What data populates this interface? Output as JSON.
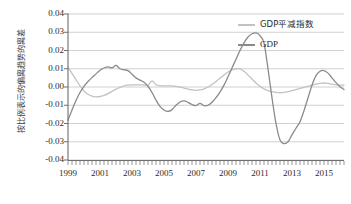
{
  "chart": {
    "type": "line",
    "title": "",
    "y_axis_title": "按比例表示的偏离趋势的离差",
    "x_axis_title": "",
    "ylim": [
      -0.04,
      0.04
    ],
    "xlim": [
      1999.0,
      2016.25
    ],
    "grid": true,
    "legend_position": "top-right",
    "y_ticks": [
      "0.04",
      "0.03",
      "0.02",
      "0.01",
      "0.00",
      "-0.01",
      "-0.02",
      "-0.03",
      "-0.04"
    ],
    "y_tick_values": [
      0.04,
      0.03,
      0.02,
      0.01,
      0.0,
      -0.01,
      -0.02,
      -0.03,
      -0.04
    ],
    "x_ticks": [
      "1999",
      "2001",
      "2003",
      "2005",
      "2007",
      "2009",
      "2011",
      "2013",
      "2015"
    ],
    "x_tick_values": [
      1999,
      2001,
      2003,
      2005,
      2007,
      2009,
      2011,
      2013,
      2015
    ],
    "colors": {
      "deflator": "#c2c2c2",
      "gdp": "#8a8a8a",
      "gridline": "#d0d0d0",
      "axis": "#6e6e6e",
      "text": "#2b2b2b"
    }
  },
  "chart_data": {
    "type": "line",
    "title": "",
    "xlabel": "",
    "ylabel": "按比例表示的偏离趋势的离差",
    "ylim": [
      -0.04,
      0.04
    ],
    "xlim": [
      1999.0,
      2016.25
    ],
    "grid": true,
    "legend_position": "top-right",
    "x_tick_labels": [
      "1999",
      "2001",
      "2003",
      "2005",
      "2007",
      "2009",
      "2011",
      "2013",
      "2015"
    ],
    "y_tick_labels": [
      "0.04",
      "0.03",
      "0.02",
      "0.01",
      "0.00",
      "-0.01",
      "-0.02",
      "-0.03",
      "-0.04"
    ],
    "x": [
      1999.0,
      1999.25,
      1999.5,
      1999.75,
      2000.0,
      2000.25,
      2000.5,
      2000.75,
      2001.0,
      2001.25,
      2001.5,
      2001.75,
      2002.0,
      2002.25,
      2002.5,
      2002.75,
      2003.0,
      2003.25,
      2003.5,
      2003.75,
      2004.0,
      2004.25,
      2004.5,
      2004.75,
      2005.0,
      2005.25,
      2005.5,
      2005.75,
      2006.0,
      2006.25,
      2006.5,
      2006.75,
      2007.0,
      2007.25,
      2007.5,
      2007.75,
      2008.0,
      2008.25,
      2008.5,
      2008.75,
      2009.0,
      2009.25,
      2009.5,
      2009.75,
      2010.0,
      2010.25,
      2010.5,
      2010.75,
      2011.0,
      2011.25,
      2011.5,
      2011.75,
      2012.0,
      2012.25,
      2012.5,
      2012.75,
      2013.0,
      2013.25,
      2013.5,
      2013.75,
      2014.0,
      2014.25,
      2014.5,
      2014.75,
      2015.0,
      2015.25,
      2015.5,
      2015.75,
      2016.0,
      2016.25
    ],
    "series": [
      {
        "name": "GDP平减指数",
        "color": "#c2c2c2",
        "values": [
          0.0108,
          0.0075,
          0.004,
          0.0006,
          -0.0022,
          -0.004,
          -0.005,
          -0.0054,
          -0.0052,
          -0.0046,
          -0.0036,
          -0.0024,
          -0.0012,
          -0.0002,
          0.0006,
          0.001,
          0.0012,
          0.0012,
          0.0012,
          0.0011,
          0.001,
          0.0034,
          0.0012,
          0.0007,
          0.0006,
          0.0006,
          0.0006,
          0.0004,
          0.0,
          -0.0006,
          -0.0012,
          -0.0016,
          -0.0018,
          -0.0016,
          -0.001,
          0.0,
          0.0014,
          0.003,
          0.0048,
          0.0066,
          0.0082,
          0.0094,
          0.01,
          0.0099,
          0.0086,
          0.0066,
          0.0044,
          0.0022,
          0.0004,
          -0.001,
          -0.002,
          -0.0026,
          -0.003,
          -0.0032,
          -0.003,
          -0.0026,
          -0.002,
          -0.0014,
          -0.0008,
          -0.0002,
          0.0004,
          0.001,
          0.0016,
          0.002,
          0.0022,
          0.002,
          0.0016,
          0.0012,
          0.001,
          0.001
        ]
      },
      {
        "name": "GDP",
        "color": "#8a8a8a",
        "values": [
          -0.0182,
          -0.0126,
          -0.0074,
          -0.003,
          0.0004,
          0.003,
          0.0052,
          0.0072,
          0.0092,
          0.0104,
          0.011,
          0.0105,
          0.0118,
          0.01,
          0.0094,
          0.009,
          0.007,
          0.005,
          0.0038,
          0.0026,
          0.0004,
          -0.003,
          -0.0072,
          -0.0106,
          -0.0126,
          -0.0134,
          -0.0124,
          -0.01,
          -0.0082,
          -0.0076,
          -0.0084,
          -0.0096,
          -0.0102,
          -0.009,
          -0.0102,
          -0.01,
          -0.0084,
          -0.0058,
          -0.0028,
          0.001,
          0.0056,
          0.0104,
          0.0152,
          0.02,
          0.0242,
          0.0274,
          0.0292,
          0.0296,
          0.0282,
          0.024,
          0.01,
          -0.006,
          -0.02,
          -0.029,
          -0.031,
          -0.03,
          -0.0262,
          -0.0226,
          -0.019,
          -0.013,
          -0.006,
          0.001,
          0.0062,
          0.0086,
          0.009,
          0.0076,
          0.005,
          0.0024,
          0.0002,
          -0.0014
        ]
      }
    ],
    "series_extra_note": ""
  },
  "legend": {
    "items": [
      {
        "label": "GDP平减指数",
        "color": "#c2c2c2"
      },
      {
        "label": "GDP",
        "color": "#8a8a8a"
      }
    ]
  }
}
